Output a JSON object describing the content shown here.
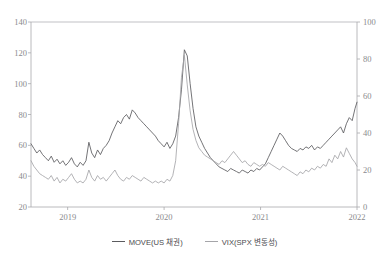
{
  "chart_data": {
    "type": "line",
    "title": "",
    "xlabel": "",
    "ylabel_left": "",
    "ylabel_right": "",
    "grid": false,
    "legend_position": "bottom-center",
    "x_tick_labels": [
      "2019",
      "2020",
      "2021",
      "2022"
    ],
    "x_tick_positions": [
      2019,
      2020,
      2021,
      2022
    ],
    "xlim": [
      2018.62,
      2022.0
    ],
    "y_left_ticks": [
      20,
      40,
      60,
      80,
      100,
      120,
      140
    ],
    "ylim_left": [
      20,
      140
    ],
    "y_right_ticks": [
      0,
      20,
      40,
      60,
      80,
      100
    ],
    "ylim_right": [
      0,
      100
    ],
    "series": [
      {
        "name": "MOVE(US 채권)",
        "axis": "left",
        "color": "#5b5b5f",
        "x": [
          2018.62,
          2018.65,
          2018.68,
          2018.71,
          2018.74,
          2018.77,
          2018.8,
          2018.83,
          2018.86,
          2018.89,
          2018.92,
          2018.95,
          2018.98,
          2019.01,
          2019.04,
          2019.07,
          2019.1,
          2019.13,
          2019.16,
          2019.19,
          2019.22,
          2019.25,
          2019.28,
          2019.31,
          2019.34,
          2019.37,
          2019.4,
          2019.43,
          2019.46,
          2019.49,
          2019.52,
          2019.55,
          2019.58,
          2019.61,
          2019.64,
          2019.67,
          2019.7,
          2019.73,
          2019.76,
          2019.79,
          2019.82,
          2019.85,
          2019.88,
          2019.91,
          2019.94,
          2019.97,
          2020.0,
          2020.03,
          2020.06,
          2020.09,
          2020.12,
          2020.15,
          2020.18,
          2020.21,
          2020.24,
          2020.27,
          2020.3,
          2020.33,
          2020.36,
          2020.39,
          2020.42,
          2020.45,
          2020.48,
          2020.51,
          2020.54,
          2020.57,
          2020.6,
          2020.63,
          2020.66,
          2020.69,
          2020.72,
          2020.75,
          2020.78,
          2020.81,
          2020.84,
          2020.87,
          2020.9,
          2020.93,
          2020.96,
          2020.99,
          2021.02,
          2021.05,
          2021.08,
          2021.11,
          2021.14,
          2021.17,
          2021.2,
          2021.23,
          2021.26,
          2021.29,
          2021.32,
          2021.35,
          2021.38,
          2021.41,
          2021.44,
          2021.47,
          2021.5,
          2021.53,
          2021.56,
          2021.59,
          2021.62,
          2021.65,
          2021.68,
          2021.71,
          2021.74,
          2021.77,
          2021.8,
          2021.83,
          2021.86,
          2021.89,
          2021.92,
          2021.95,
          2021.98,
          2022.0
        ],
        "y": [
          61,
          58,
          55,
          57,
          54,
          52,
          50,
          53,
          49,
          51,
          48,
          50,
          47,
          49,
          52,
          48,
          46,
          49,
          47,
          50,
          62,
          55,
          52,
          57,
          54,
          58,
          60,
          63,
          68,
          72,
          76,
          74,
          78,
          80,
          77,
          83,
          81,
          78,
          76,
          74,
          72,
          70,
          68,
          66,
          63,
          61,
          59,
          62,
          58,
          61,
          66,
          78,
          96,
          122,
          118,
          100,
          84,
          72,
          66,
          62,
          58,
          55,
          52,
          50,
          48,
          46,
          45,
          44,
          43,
          45,
          44,
          43,
          42,
          44,
          43,
          42,
          44,
          43,
          45,
          44,
          46,
          48,
          52,
          56,
          60,
          64,
          68,
          66,
          63,
          60,
          58,
          57,
          56,
          58,
          57,
          59,
          58,
          60,
          57,
          59,
          58,
          60,
          62,
          64,
          66,
          68,
          70,
          72,
          68,
          74,
          78,
          76,
          84,
          88
        ]
      },
      {
        "name": "VIX(SPX 변동성)",
        "axis": "right",
        "color": "#a5a5a9",
        "x": [
          2018.62,
          2018.65,
          2018.68,
          2018.71,
          2018.74,
          2018.77,
          2018.8,
          2018.83,
          2018.86,
          2018.89,
          2018.92,
          2018.95,
          2018.98,
          2019.01,
          2019.04,
          2019.07,
          2019.1,
          2019.13,
          2019.16,
          2019.19,
          2019.22,
          2019.25,
          2019.28,
          2019.31,
          2019.34,
          2019.37,
          2019.4,
          2019.43,
          2019.46,
          2019.49,
          2019.52,
          2019.55,
          2019.58,
          2019.61,
          2019.64,
          2019.67,
          2019.7,
          2019.73,
          2019.76,
          2019.79,
          2019.82,
          2019.85,
          2019.88,
          2019.91,
          2019.94,
          2019.97,
          2020.0,
          2020.03,
          2020.06,
          2020.09,
          2020.12,
          2020.15,
          2020.18,
          2020.21,
          2020.24,
          2020.27,
          2020.3,
          2020.33,
          2020.36,
          2020.39,
          2020.42,
          2020.45,
          2020.48,
          2020.51,
          2020.54,
          2020.57,
          2020.6,
          2020.63,
          2020.66,
          2020.69,
          2020.72,
          2020.75,
          2020.78,
          2020.81,
          2020.84,
          2020.87,
          2020.9,
          2020.93,
          2020.96,
          2020.99,
          2021.02,
          2021.05,
          2021.08,
          2021.11,
          2021.14,
          2021.17,
          2021.2,
          2021.23,
          2021.26,
          2021.29,
          2021.32,
          2021.35,
          2021.38,
          2021.41,
          2021.44,
          2021.47,
          2021.5,
          2021.53,
          2021.56,
          2021.59,
          2021.62,
          2021.65,
          2021.68,
          2021.71,
          2021.74,
          2021.77,
          2021.8,
          2021.83,
          2021.86,
          2021.89,
          2021.92,
          2021.95,
          2021.98,
          2022.0
        ],
        "y": [
          25,
          22,
          20,
          18,
          17,
          16,
          15,
          17,
          14,
          16,
          13,
          15,
          14,
          16,
          18,
          15,
          13,
          14,
          13,
          15,
          20,
          16,
          14,
          17,
          15,
          16,
          14,
          16,
          18,
          20,
          17,
          15,
          14,
          16,
          15,
          17,
          16,
          15,
          14,
          16,
          15,
          14,
          13,
          14,
          13,
          14,
          13,
          15,
          14,
          17,
          25,
          45,
          70,
          82,
          66,
          52,
          42,
          36,
          32,
          30,
          28,
          27,
          26,
          25,
          24,
          23,
          25,
          24,
          26,
          28,
          30,
          28,
          26,
          24,
          25,
          23,
          22,
          24,
          23,
          22,
          23,
          22,
          24,
          23,
          22,
          21,
          20,
          22,
          21,
          20,
          19,
          18,
          17,
          19,
          18,
          20,
          19,
          21,
          20,
          22,
          21,
          23,
          22,
          26,
          24,
          28,
          26,
          30,
          27,
          32,
          29,
          26,
          24,
          22
        ]
      }
    ]
  },
  "legend": {
    "items": [
      {
        "label": "MOVE(US 채권)"
      },
      {
        "label": "VIX(SPX 변동성)"
      }
    ]
  },
  "axes": {
    "left_tick_labels": [
      "140",
      "120",
      "100",
      "80",
      "60",
      "40",
      "20"
    ],
    "right_tick_labels": [
      "100",
      "80",
      "60",
      "40",
      "20",
      "0"
    ],
    "x_tick_labels": [
      "2019",
      "2020",
      "2021",
      "2022"
    ]
  },
  "colors": {
    "move_line": "#5b5b5f",
    "vix_line": "#a5a5a9",
    "axis": "#a8a8ac",
    "tick_text": "#8a8a8e"
  }
}
